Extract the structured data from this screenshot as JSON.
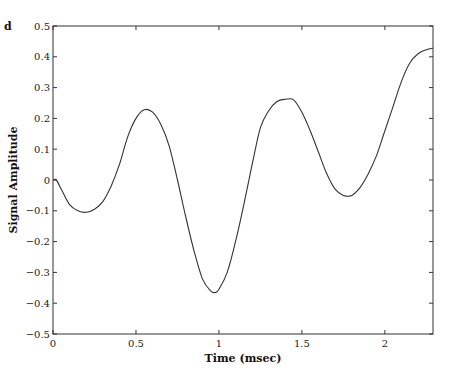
{
  "panel_label": "d",
  "chart_data": {
    "type": "line",
    "title": "",
    "xlabel": "Time (msec)",
    "ylabel": "Signal Amplitude",
    "xlim": [
      0,
      2.29
    ],
    "ylim": [
      -0.5,
      0.5
    ],
    "grid": false,
    "legend": null,
    "x_ticks": [
      0,
      0.5,
      1,
      1.5,
      2
    ],
    "x_tick_labels": [
      "0",
      "0.5",
      "1",
      "1.5",
      "2"
    ],
    "y_ticks": [
      0.5,
      0.4,
      0.3,
      0.2,
      0.1,
      0,
      -0.1,
      -0.2,
      -0.3,
      -0.4,
      -0.5
    ],
    "y_tick_labels": [
      "0.5",
      "0.4",
      "0.3",
      "0.2",
      "0.1",
      "0",
      "−0.1",
      "−0.2",
      "−0.3",
      "−0.4",
      "−0.5"
    ],
    "series": [
      {
        "name": "signal",
        "color": "#333333",
        "x": [
          0,
          0.02,
          0.05,
          0.1,
          0.15,
          0.2,
          0.25,
          0.3,
          0.35,
          0.4,
          0.45,
          0.5,
          0.55,
          0.6,
          0.65,
          0.7,
          0.75,
          0.8,
          0.85,
          0.9,
          0.95,
          0.98,
          1.0,
          1.05,
          1.1,
          1.15,
          1.2,
          1.25,
          1.3,
          1.35,
          1.4,
          1.45,
          1.5,
          1.55,
          1.6,
          1.65,
          1.7,
          1.75,
          1.8,
          1.85,
          1.9,
          1.95,
          2.0,
          2.05,
          2.1,
          2.15,
          2.2,
          2.25,
          2.29
        ],
        "values": [
          0,
          0,
          -0.03,
          -0.08,
          -0.1,
          -0.105,
          -0.095,
          -0.07,
          -0.02,
          0.05,
          0.14,
          0.2,
          0.228,
          0.22,
          0.18,
          0.11,
          0.0,
          -0.12,
          -0.23,
          -0.32,
          -0.36,
          -0.365,
          -0.355,
          -0.3,
          -0.2,
          -0.08,
          0.05,
          0.17,
          0.225,
          0.255,
          0.262,
          0.26,
          0.22,
          0.16,
          0.09,
          0.02,
          -0.03,
          -0.05,
          -0.05,
          -0.025,
          0.02,
          0.08,
          0.16,
          0.24,
          0.32,
          0.38,
          0.41,
          0.423,
          0.428
        ]
      }
    ]
  }
}
